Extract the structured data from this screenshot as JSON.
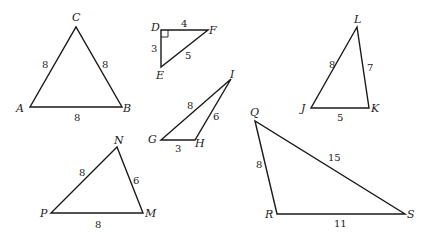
{
  "triangles": {
    "abc": {
      "vertices": {
        "A": "A",
        "B": "B",
        "C": "C"
      },
      "sides": {
        "AC": "8",
        "BC": "8",
        "AB": "8"
      }
    },
    "def": {
      "vertices": {
        "D": "D",
        "E": "E",
        "F": "F"
      },
      "sides": {
        "DF": "4",
        "DE": "3",
        "EF": "5"
      },
      "right_angle_at": "D"
    },
    "ghi": {
      "vertices": {
        "G": "G",
        "H": "H",
        "I": "I"
      },
      "sides": {
        "GI": "8",
        "HI": "6",
        "GH": "3"
      }
    },
    "jkl": {
      "vertices": {
        "J": "J",
        "K": "K",
        "L": "L"
      },
      "sides": {
        "JL": "8",
        "KL": "7",
        "JK": "5"
      }
    },
    "mnp": {
      "vertices": {
        "N": "N",
        "P": "P",
        "M": "M"
      },
      "sides": {
        "PN": "8",
        "NM": "6",
        "PM": "8"
      }
    },
    "qrs": {
      "vertices": {
        "Q": "Q",
        "R": "R",
        "S": "S"
      },
      "sides": {
        "QR": "8",
        "QS": "15",
        "RS": "11"
      }
    }
  }
}
